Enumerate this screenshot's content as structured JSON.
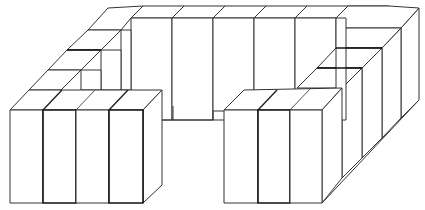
{
  "figure": {
    "description": "Line drawing of rectangular blocks arranged in a U shape (open toward the viewer)",
    "stroke_color": "#333333",
    "background": "#ffffff",
    "groups": [
      {
        "name": "left-front-group",
        "block_count": 4
      },
      {
        "name": "left-arm",
        "block_count": 5
      },
      {
        "name": "back-row",
        "block_count": 7
      },
      {
        "name": "right-arm",
        "block_count": 5
      },
      {
        "name": "right-front-group",
        "block_count": 3
      }
    ]
  }
}
